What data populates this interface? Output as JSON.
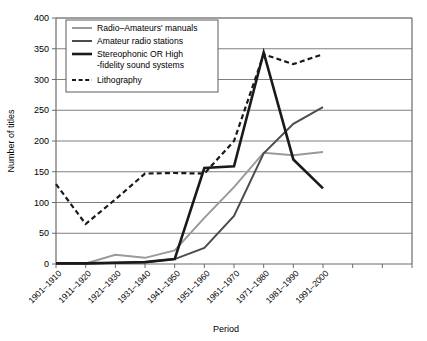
{
  "chart_data": {
    "type": "line",
    "title": "",
    "xlabel": "Period",
    "ylabel": "Number of titles",
    "ylim": [
      0,
      400
    ],
    "ytick_step": 50,
    "yticks": [
      "0",
      "50",
      "100",
      "150",
      "200",
      "250",
      "300",
      "350",
      "400"
    ],
    "grid": true,
    "legend_position": "upper-left-inside",
    "categories": [
      "1901–1910",
      "1911–1920",
      "1921–1930",
      "1931–1940",
      "1941–1950",
      "1951–1960",
      "1961–1970",
      "1971–1980",
      "1981–1990",
      "1991–2000"
    ],
    "extra_unlabeled_ticks": 2,
    "series": [
      {
        "name": "Radio–Amateurs' manuals",
        "color": "#9a9a9a",
        "width": 2.0,
        "dash": "none",
        "values": [
          1,
          1,
          15,
          10,
          22,
          75,
          125,
          181,
          177,
          182
        ]
      },
      {
        "name": "Amateur radio stations",
        "color": "#4d4d4d",
        "width": 2.0,
        "dash": "none",
        "values": [
          1,
          1,
          2,
          3,
          8,
          26,
          78,
          180,
          228,
          255
        ]
      },
      {
        "name": "Stereophonic OR High -fidelity sound systems",
        "color": "#1a1a1a",
        "width": 2.6,
        "dash": "none",
        "values": [
          1,
          1,
          2,
          3,
          8,
          156,
          159,
          344,
          170,
          123
        ]
      },
      {
        "name": "Lithography",
        "color": "#1a1a1a",
        "width": 2.2,
        "dash": "dashed",
        "values": [
          130,
          65,
          105,
          147,
          148,
          147,
          200,
          341,
          325,
          341
        ]
      }
    ]
  },
  "legend": {
    "items": [
      {
        "label_line1": "Radio–Amateurs' manuals",
        "label_line2": ""
      },
      {
        "label_line1": "Amateur radio stations",
        "label_line2": ""
      },
      {
        "label_line1": "Stereophonic OR High",
        "label_line2": "-fidelity sound systems"
      },
      {
        "label_line1": "Lithography",
        "label_line2": ""
      }
    ]
  }
}
